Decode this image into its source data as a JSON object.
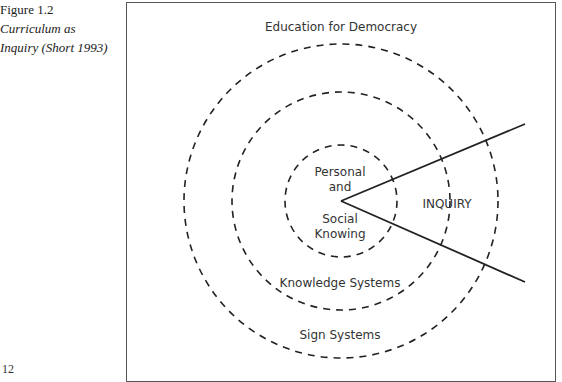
{
  "caption": {
    "figure_number": "Figure 1.2",
    "title_line1": "Curriculum as",
    "title_line2": "Inquiry (Short 1993)"
  },
  "page_number": "12",
  "diagram": {
    "outer_label": "Education for Democracy",
    "rings": [
      {
        "name": "inner",
        "label_line1": "Personal",
        "label_line2": "and",
        "label_line3": "Social",
        "label_line4": "Knowing"
      },
      {
        "name": "middle",
        "label": "Knowledge Systems"
      },
      {
        "name": "outer",
        "label": "Sign Systems"
      }
    ],
    "wedge_label": "INQUIRY",
    "colors": {
      "stroke": "#222222",
      "text": "#333333",
      "border": "#555555"
    }
  }
}
